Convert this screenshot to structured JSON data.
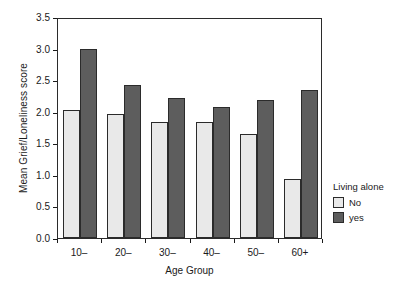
{
  "chart_data": {
    "type": "bar",
    "title": "",
    "xlabel": "Age Group",
    "ylabel": "Mean Grief/Loneliness score",
    "categories": [
      "10–",
      "20–",
      "30–",
      "40–",
      "50–",
      "60+"
    ],
    "series": [
      {
        "name": "No",
        "values": [
          2.03,
          1.97,
          1.84,
          1.84,
          1.65,
          0.93
        ],
        "color": "#e9e9e9"
      },
      {
        "name": "yes",
        "values": [
          2.99,
          2.43,
          2.21,
          2.08,
          2.19,
          2.34
        ],
        "color": "#5d5d5d"
      }
    ],
    "ylim": [
      0.0,
      3.5
    ],
    "yticks": [
      "0.0",
      "0.5",
      "1.0",
      "1.5",
      "2.0",
      "2.5",
      "3.0",
      "3.5"
    ],
    "ytick_values": [
      0.0,
      0.5,
      1.0,
      1.5,
      2.0,
      2.5,
      3.0,
      3.5
    ],
    "grid": false,
    "legend_position": "right"
  },
  "legend": {
    "title": "Living alone",
    "entries": [
      {
        "label": "No"
      },
      {
        "label": "yes"
      }
    ]
  }
}
